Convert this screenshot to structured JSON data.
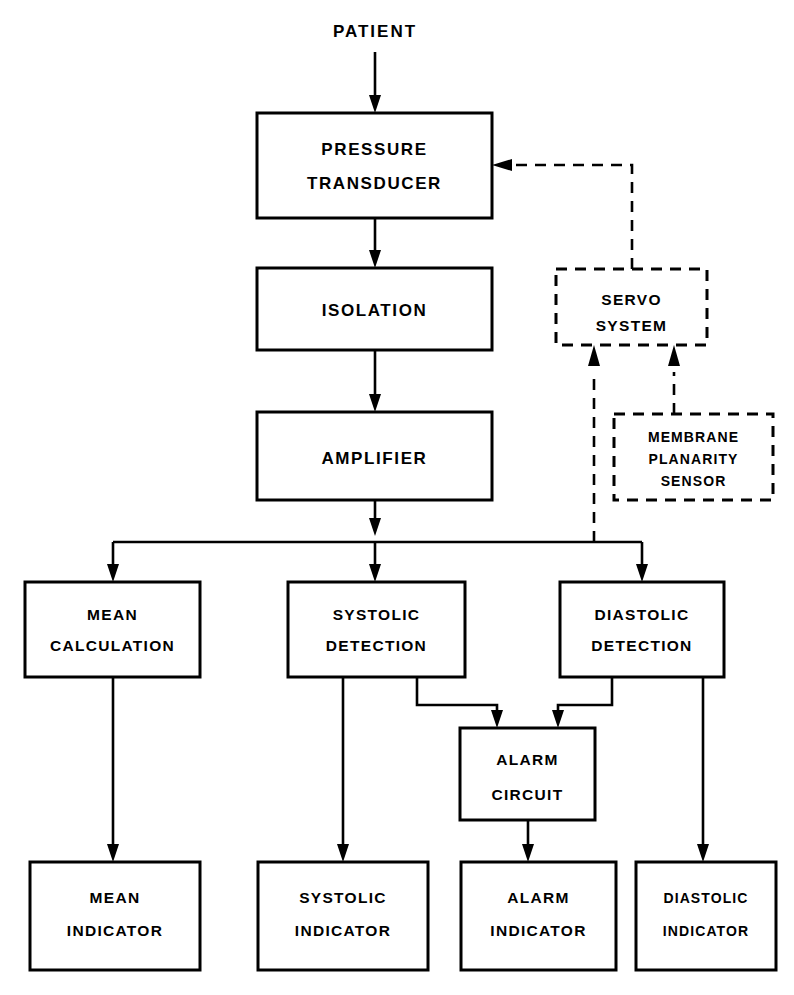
{
  "diagram": {
    "background_color": "#ffffff",
    "line_color": "#000000",
    "source_label": "PATIENT",
    "blocks": [
      {
        "id": "pressure_transducer",
        "style": "solid",
        "lines": [
          "PRESSURE",
          "TRANSDUCER"
        ]
      },
      {
        "id": "isolation",
        "style": "solid",
        "lines": [
          "ISOLATION"
        ]
      },
      {
        "id": "amplifier",
        "style": "solid",
        "lines": [
          "AMPLIFIER"
        ]
      },
      {
        "id": "servo_system",
        "style": "dashed",
        "lines": [
          "SERVO",
          "SYSTEM"
        ]
      },
      {
        "id": "membrane_planarity_sensor",
        "style": "dashed",
        "lines": [
          "MEMBRANE",
          "PLANARITY",
          "SENSOR"
        ]
      },
      {
        "id": "mean_calculation",
        "style": "solid",
        "lines": [
          "MEAN",
          "CALCULATION"
        ]
      },
      {
        "id": "systolic_detection",
        "style": "solid",
        "lines": [
          "SYSTOLIC",
          "DETECTION"
        ]
      },
      {
        "id": "diastolic_detection",
        "style": "solid",
        "lines": [
          "DIASTOLIC",
          "DETECTION"
        ]
      },
      {
        "id": "alarm_circuit",
        "style": "solid",
        "lines": [
          "ALARM",
          "CIRCUIT"
        ]
      },
      {
        "id": "mean_indicator",
        "style": "solid",
        "lines": [
          "MEAN",
          "INDICATOR"
        ]
      },
      {
        "id": "systolic_indicator",
        "style": "solid",
        "lines": [
          "SYSTOLIC",
          "INDICATOR"
        ]
      },
      {
        "id": "alarm_indicator",
        "style": "solid",
        "lines": [
          "ALARM",
          "INDICATOR"
        ]
      },
      {
        "id": "diastolic_indicator",
        "style": "solid",
        "lines": [
          "DIASTOLIC",
          "INDICATOR"
        ]
      }
    ],
    "connections": [
      {
        "from": "PATIENT",
        "to": "PRESSURE TRANSDUCER",
        "style": "solid"
      },
      {
        "from": "PRESSURE TRANSDUCER",
        "to": "ISOLATION",
        "style": "solid"
      },
      {
        "from": "ISOLATION",
        "to": "AMPLIFIER",
        "style": "solid"
      },
      {
        "from": "AMPLIFIER",
        "to": "MEAN CALCULATION",
        "style": "solid"
      },
      {
        "from": "AMPLIFIER",
        "to": "SYSTOLIC DETECTION",
        "style": "solid"
      },
      {
        "from": "AMPLIFIER",
        "to": "DIASTOLIC DETECTION",
        "style": "solid"
      },
      {
        "from": "AMPLIFIER OUTPUT BUS",
        "to": "SERVO SYSTEM",
        "style": "dashed"
      },
      {
        "from": "MEMBRANE PLANARITY SENSOR",
        "to": "SERVO SYSTEM",
        "style": "dashed"
      },
      {
        "from": "SERVO SYSTEM",
        "to": "PRESSURE TRANSDUCER",
        "style": "dashed"
      },
      {
        "from": "MEAN CALCULATION",
        "to": "MEAN INDICATOR",
        "style": "solid"
      },
      {
        "from": "SYSTOLIC DETECTION",
        "to": "SYSTOLIC INDICATOR",
        "style": "solid"
      },
      {
        "from": "SYSTOLIC DETECTION",
        "to": "ALARM CIRCUIT",
        "style": "solid"
      },
      {
        "from": "DIASTOLIC DETECTION",
        "to": "ALARM CIRCUIT",
        "style": "solid"
      },
      {
        "from": "DIASTOLIC DETECTION",
        "to": "DIASTOLIC INDICATOR",
        "style": "solid"
      },
      {
        "from": "ALARM CIRCUIT",
        "to": "ALARM INDICATOR",
        "style": "solid"
      }
    ],
    "labels": {
      "patient": "PATIENT",
      "pressure_l1": "PRESSURE",
      "pressure_l2": "TRANSDUCER",
      "isolation_l1": "ISOLATION",
      "amplifier_l1": "AMPLIFIER",
      "servo_l1": "SERVO",
      "servo_l2": "SYSTEM",
      "membrane_l1": "MEMBRANE",
      "membrane_l2": "PLANARITY",
      "membrane_l3": "SENSOR",
      "meancalc_l1": "MEAN",
      "meancalc_l2": "CALCULATION",
      "systdet_l1": "SYSTOLIC",
      "systdet_l2": "DETECTION",
      "diasdet_l1": "DIASTOLIC",
      "diasdet_l2": "DETECTION",
      "alarmckt_l1": "ALARM",
      "alarmckt_l2": "CIRCUIT",
      "meanind_l1": "MEAN",
      "meanind_l2": "INDICATOR",
      "systind_l1": "SYSTOLIC",
      "systind_l2": "INDICATOR",
      "alarmind_l1": "ALARM",
      "alarmind_l2": "INDICATOR",
      "diasind_l1": "DIASTOLIC",
      "diasind_l2": "INDICATOR"
    }
  }
}
